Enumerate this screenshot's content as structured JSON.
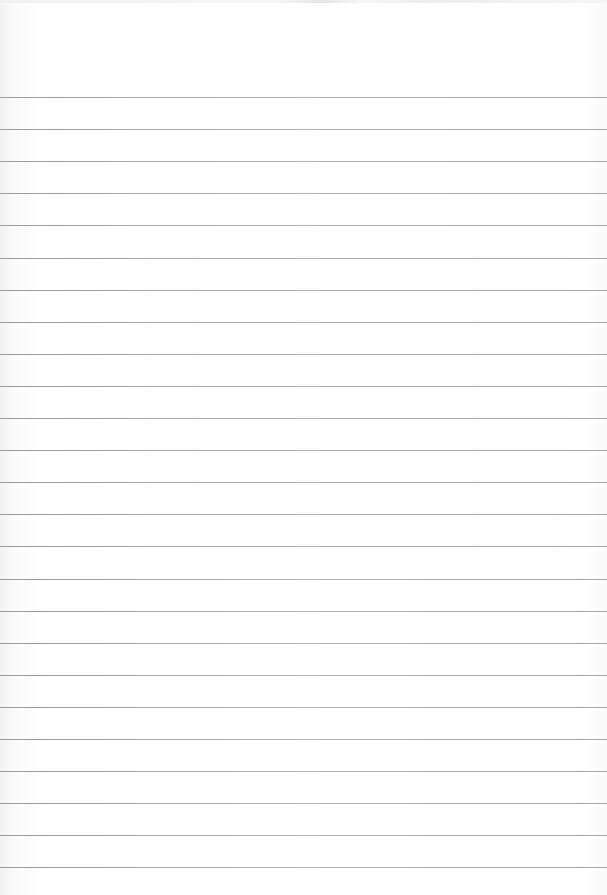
{
  "image": {
    "description": "Blank sheet of ruled notebook paper",
    "width": 607,
    "height": 895,
    "background_color": "#ffffff",
    "rule_color": "#a8a8a8"
  },
  "rules": {
    "count": 25,
    "first_y": 97,
    "spacing": 32.1
  }
}
